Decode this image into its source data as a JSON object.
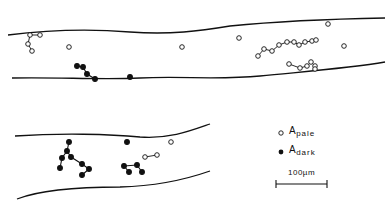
{
  "legend": {
    "pale": {
      "symbol": "open-circle",
      "label_main": "A",
      "label_sub": "pale"
    },
    "dark": {
      "symbol": "filled-circle",
      "label_main": "A",
      "label_sub": "dark"
    }
  },
  "scale_bar": {
    "label": "100µm"
  },
  "colors": {
    "ink": "#111111",
    "background": "#ffffff"
  }
}
